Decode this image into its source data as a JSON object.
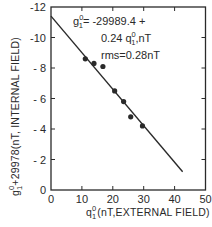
{
  "chart_data": {
    "type": "scatter",
    "title": "",
    "xlabel": "q₁⁰ (nT, EXTERNAL FIELD)",
    "ylabel": "g₁⁰+29978 (nT, INTERNAL FIELD)",
    "xlabel_parts": {
      "sym": "q",
      "sub": "1",
      "sup": "0",
      "rest": "(nT,EXTERNAL FIELD)"
    },
    "ylabel_parts": {
      "sym": "g",
      "sub": "1",
      "sup": "0",
      "rest": "+29978(nT, INTERNAL FIELD)"
    },
    "xlim": [
      0,
      50
    ],
    "ylim": [
      0,
      -12
    ],
    "xticks": [
      0,
      10,
      20,
      30,
      40,
      50
    ],
    "xtick_labels": [
      "0",
      "10",
      "20",
      "30",
      "40",
      "50"
    ],
    "yticks": [
      0,
      -2,
      -4,
      -6,
      -8,
      -10,
      -12
    ],
    "ytick_labels": [
      "0",
      "- 2",
      "- 4",
      "- 6",
      "- 8",
      "-10",
      "-12"
    ],
    "grid": false,
    "legend": null,
    "series": [
      {
        "name": "observations",
        "type": "scatter",
        "x": [
          11.1,
          13.9,
          16.8,
          20.6,
          23.5,
          25.8,
          29.6
        ],
        "y": [
          -8.6,
          -8.3,
          -8.1,
          -6.5,
          -5.8,
          -4.8,
          -4.2
        ]
      },
      {
        "name": "regression fit",
        "type": "line",
        "x": [
          0,
          42.6
        ],
        "y": [
          -11.4,
          -1.2
        ],
        "intercept": -11.4,
        "slope": 0.24
      }
    ],
    "annotations": [
      {
        "text": "g₁⁰= -29989.4 +",
        "parts": {
          "sym": "g",
          "sub": "1",
          "sup": "0",
          "rest": "= -29989.4 +"
        }
      },
      {
        "text": "0.24 q₁⁰,nT",
        "parts": {
          "pre": "0.24 ",
          "sym": "q",
          "sub": "1",
          "sup": "0",
          "rest": ",nT"
        }
      },
      {
        "text": "rms=0.28nT"
      }
    ]
  },
  "colors": {
    "ink": "#2a2a2a",
    "background": "#ffffff"
  }
}
